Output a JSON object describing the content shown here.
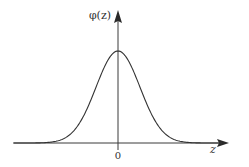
{
  "figure": {
    "y_axis_label": "φ(z)",
    "x_axis_label": "z",
    "origin_label": "0"
  },
  "colors": {
    "background": "#ffffff",
    "ink": "#333333"
  },
  "chart_data": {
    "type": "line",
    "title": "",
    "xlabel": "z",
    "ylabel": "φ(z)",
    "function": "phi(z) = (1/sqrt(2*pi)) * exp(-z^2/2)",
    "x_tick_labels": [
      "0"
    ],
    "y_tick_labels": [],
    "grid": false,
    "legend": null,
    "peak": {
      "x": 0,
      "y": 0.3989
    },
    "series": [
      {
        "name": "φ(z)",
        "x": [
          -4,
          -3,
          -2.5,
          -2,
          -1.5,
          -1,
          -0.5,
          0,
          0.5,
          1,
          1.5,
          2,
          2.5,
          3,
          4
        ],
        "values": [
          0.0001,
          0.0044,
          0.0175,
          0.054,
          0.1295,
          0.242,
          0.3521,
          0.3989,
          0.3521,
          0.242,
          0.1295,
          0.054,
          0.0175,
          0.0044,
          0.0001
        ]
      }
    ],
    "pixel_geometry": {
      "origin_px": [
        118,
        143
      ],
      "sigma_px": 22,
      "peak_height_px": 92
    }
  }
}
